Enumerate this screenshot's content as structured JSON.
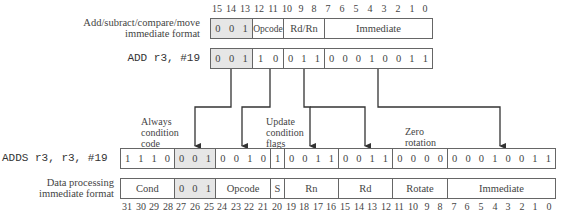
{
  "top_format": {
    "label_line1": "Add/subract/compare/move",
    "label_line2": "immediate format",
    "bit_numbers": [
      "15",
      "14",
      "13",
      "12",
      "11",
      "10",
      "9",
      "8",
      "7",
      "6",
      "5",
      "4",
      "3",
      "2",
      "1",
      "0"
    ],
    "fields": [
      {
        "name": "",
        "bits": [
          "0",
          "0",
          "1"
        ],
        "shaded": true
      },
      {
        "name": "Opcode"
      },
      {
        "name": "Rd/Rn"
      },
      {
        "name": "Immediate"
      }
    ]
  },
  "top_instruction": {
    "text": "ADD r3, #19",
    "fields": [
      {
        "bits": [
          "0",
          "0",
          "1"
        ],
        "shaded": true
      },
      {
        "bits": [
          "1",
          "0"
        ]
      },
      {
        "bits": [
          "0",
          "1",
          "1"
        ]
      },
      {
        "bits": [
          "0",
          "0",
          "0",
          "1",
          "0",
          "0",
          "1",
          "1"
        ]
      }
    ]
  },
  "annotations": {
    "always_condition": [
      "Always",
      "condition",
      "code"
    ],
    "update_flags": [
      "Update",
      "condition",
      "flags"
    ],
    "zero_rotation": [
      "Zero",
      "rotation"
    ]
  },
  "bottom_instruction": {
    "text": "ADDS r3, r3, #19",
    "fields": [
      {
        "bits": [
          "1",
          "1",
          "1",
          "0"
        ]
      },
      {
        "bits": [
          "0",
          "0",
          "1"
        ],
        "shaded": true
      },
      {
        "bits": [
          "0",
          "0",
          "1",
          "0"
        ]
      },
      {
        "bits": [
          "1"
        ]
      },
      {
        "bits": [
          "0",
          "0",
          "1",
          "1"
        ]
      },
      {
        "bits": [
          "0",
          "0",
          "1",
          "1"
        ]
      },
      {
        "bits": [
          "0",
          "0",
          "0",
          "0"
        ]
      },
      {
        "bits": [
          "0",
          "0",
          "0",
          "1",
          "0",
          "0",
          "1",
          "1"
        ]
      }
    ]
  },
  "bottom_format": {
    "label_line1": "Data processing",
    "label_line2": "immediate format",
    "fields": [
      {
        "name": "Cond"
      },
      {
        "name": "",
        "bits": [
          "0",
          "0",
          "1"
        ],
        "shaded": true
      },
      {
        "name": "Opcode"
      },
      {
        "name": "S"
      },
      {
        "name": "Rn"
      },
      {
        "name": "Rd"
      },
      {
        "name": "Rotate"
      },
      {
        "name": "Immediate"
      }
    ],
    "bit_numbers": [
      "31",
      "30",
      "29",
      "28",
      "27",
      "26",
      "25",
      "24",
      "23",
      "22",
      "21",
      "20",
      "19",
      "18",
      "17",
      "16",
      "15",
      "14",
      "13",
      "12",
      "11",
      "10",
      "9",
      "8",
      "7",
      "6",
      "5",
      "4",
      "3",
      "2",
      "1",
      "0"
    ]
  }
}
